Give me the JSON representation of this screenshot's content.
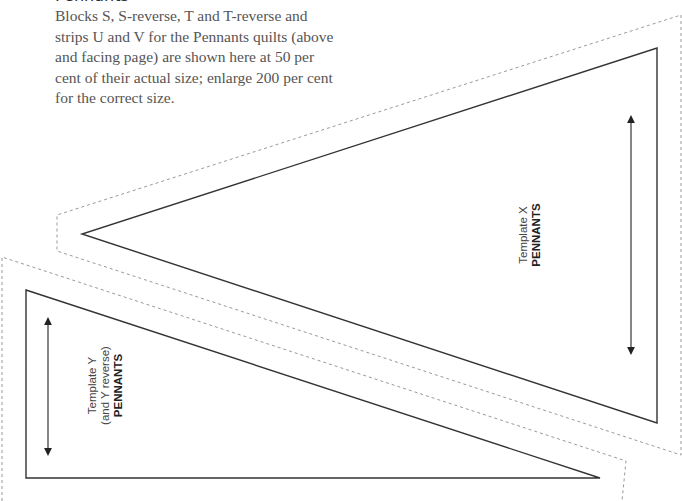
{
  "page": {
    "heading": "Pennants",
    "intro": "Blocks S, S-reverse, T and T-reverse and strips U and V for the Pennants quilts (above and facing page) are shown here at 50 per cent of their actual size; enlarge 200 per cent for the correct size."
  },
  "templates": [
    {
      "id": "X",
      "line1": "Template X",
      "name": "PENNANTS",
      "cut_line": [
        [
          657,
          48
        ],
        [
          657,
          423
        ],
        [
          82,
          234
        ]
      ],
      "seam_line": [
        [
          681,
          15
        ],
        [
          681,
          455
        ],
        [
          57,
          251
        ],
        [
          57,
          215
        ]
      ],
      "grain_arrow": {
        "x": 631,
        "y1": 115,
        "y2": 355
      }
    },
    {
      "id": "Y",
      "line1": "Template Y",
      "line2": "(and Y reverse)",
      "name": "PENNANTS",
      "cut_line": [
        [
          26,
          290
        ],
        [
          600,
          478
        ],
        [
          26,
          478
        ]
      ],
      "seam_line": [
        [
          2,
          257
        ],
        [
          626,
          461
        ],
        [
          622,
          501
        ]
      ],
      "grain_arrow": {
        "x": 48,
        "y1": 317,
        "y2": 456
      }
    }
  ],
  "colors": {
    "solid_line": "#333333",
    "dashed_line": "#999999",
    "text": "#555555"
  }
}
